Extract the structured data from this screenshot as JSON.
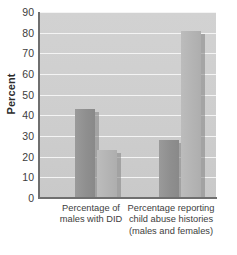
{
  "chart_data": {
    "type": "bar",
    "title": "",
    "subtitle": "",
    "xlabel": "",
    "ylabel": "Percent",
    "ylim": [
      0,
      90
    ],
    "ytick_step": 10,
    "yticks": [
      90,
      80,
      70,
      60,
      50,
      40,
      30,
      20,
      10,
      0
    ],
    "grid": true,
    "legend": false,
    "legend_position": "none",
    "categories": [
      "Percentage of males with DID",
      "Percentage reporting child abuse histories (males and females)"
    ],
    "category_lines": [
      [
        "Percentage of",
        "males with DID"
      ],
      [
        "Percentage reporting",
        "child abuse histories",
        "(males and females)"
      ]
    ],
    "series": [
      {
        "name": "series-dark",
        "values": [
          43,
          28
        ],
        "color": "#8f8f8f"
      },
      {
        "name": "series-light",
        "values": [
          23,
          81
        ],
        "color": "#b4b4b4"
      }
    ],
    "bars": [
      {
        "group": 0,
        "series": 0,
        "value": 43,
        "style": "series-dark"
      },
      {
        "group": 0,
        "series": 1,
        "value": 23,
        "style": "series-light"
      },
      {
        "group": 1,
        "series": 0,
        "value": 28,
        "style": "series-dark"
      },
      {
        "group": 1,
        "series": 1,
        "value": 81,
        "style": "series-light"
      }
    ],
    "colors": {
      "plot_background": "#cfcfcf",
      "gridline": "#f4f4f4",
      "axis": "#6f6f6f",
      "bar_dark": "#8f8f8f",
      "bar_light": "#b4b4b4",
      "text": "#3d3d3d",
      "page_background": "#ffffff"
    }
  }
}
